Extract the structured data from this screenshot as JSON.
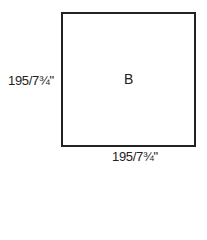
{
  "diagram": {
    "shape": "square",
    "center_label": "B",
    "height_dimension": "195/7¾\"",
    "width_dimension": "195/7¾\"",
    "stroke_color": "#222222",
    "background": "#ffffff"
  }
}
